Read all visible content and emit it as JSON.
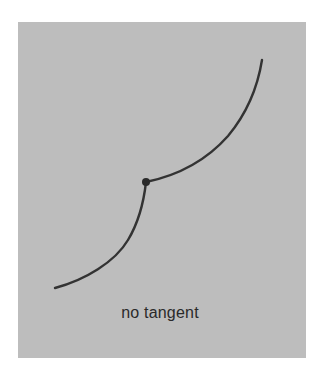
{
  "figure": {
    "caption": "no tangent",
    "background_color": "#bdbdbd",
    "curve_color": "#333333",
    "point_color": "#2a2a2a",
    "curve": {
      "lower_branch": "M55,288 C85,280 115,262 128,240 C140,220 144,200 146,182",
      "upper_branch": "M146,182 C175,176 205,162 228,136 C248,112 258,85 262,60"
    },
    "cusp_point": {
      "x": 146,
      "y": 182,
      "r": 4
    }
  }
}
